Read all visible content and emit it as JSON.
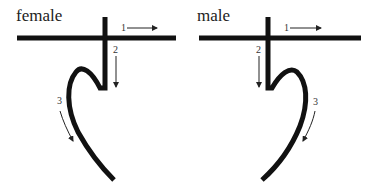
{
  "panels": [
    {
      "title": "female",
      "steps": [
        {
          "label": "1",
          "description": "horizontal stroke, left to right"
        },
        {
          "label": "2",
          "description": "vertical stroke, downward"
        },
        {
          "label": "3",
          "description": "curved stroke, downward"
        }
      ]
    },
    {
      "title": "male",
      "steps": [
        {
          "label": "1",
          "description": "horizontal stroke, left to right"
        },
        {
          "label": "2",
          "description": "vertical stroke, downward"
        },
        {
          "label": "3",
          "description": "curved stroke, downward"
        }
      ]
    }
  ],
  "colors": {
    "stroke": "#111111",
    "background": "#ffffff"
  }
}
